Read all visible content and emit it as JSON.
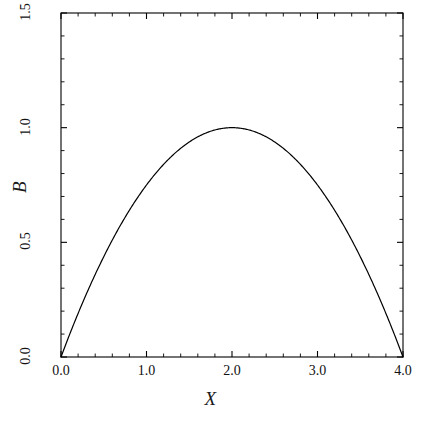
{
  "chart_data": {
    "type": "line",
    "title": "",
    "xlabel": "X",
    "ylabel": "B",
    "xlim": [
      0.0,
      4.0
    ],
    "ylim": [
      0.0,
      1.5
    ],
    "grid": false,
    "legend": false,
    "legend_position": "none",
    "line_color": "#000000",
    "background_color": "#ffffff",
    "frame_color": "#000000",
    "xticks": [
      0.0,
      1.0,
      2.0,
      3.0,
      4.0
    ],
    "xtick_labels": [
      "0.0",
      "1.0",
      "2.0",
      "3.0",
      "4.0"
    ],
    "yticks": [
      0.0,
      0.5,
      1.0,
      1.5
    ],
    "ytick_labels": [
      "0.0",
      "0.5",
      "1.0",
      "1.5"
    ],
    "minor_ticks_per_major_x": 5,
    "minor_ticks_per_major_y": 5,
    "tick_direction": "in",
    "formula": "B = X*(4-X)/4",
    "series": [
      {
        "name": "B(X)",
        "x": [
          0.0,
          0.1,
          0.2,
          0.3,
          0.4,
          0.5,
          0.6,
          0.7,
          0.8,
          0.9,
          1.0,
          1.1,
          1.2,
          1.3,
          1.4,
          1.5,
          1.6,
          1.7,
          1.8,
          1.9,
          2.0,
          2.1,
          2.2,
          2.3,
          2.4,
          2.5,
          2.6,
          2.7,
          2.8,
          2.9,
          3.0,
          3.1,
          3.2,
          3.3,
          3.4,
          3.5,
          3.6,
          3.7,
          3.8,
          3.9,
          4.0
        ],
        "values": [
          0.0,
          0.0975,
          0.19,
          0.2775,
          0.36,
          0.4375,
          0.51,
          0.5775,
          0.64,
          0.6975,
          0.75,
          0.7975,
          0.84,
          0.8775,
          0.91,
          0.9375,
          0.96,
          0.9775,
          0.99,
          0.9975,
          1.0,
          0.9975,
          0.99,
          0.9775,
          0.96,
          0.9375,
          0.91,
          0.8775,
          0.84,
          0.7975,
          0.75,
          0.6975,
          0.64,
          0.5775,
          0.51,
          0.4375,
          0.36,
          0.2775,
          0.19,
          0.0975,
          0.0
        ]
      }
    ],
    "annotations": []
  },
  "axes": {
    "x_title": "X",
    "y_title": "B"
  }
}
